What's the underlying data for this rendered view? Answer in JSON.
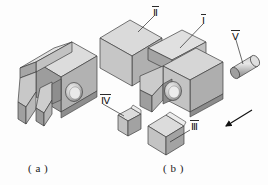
{
  "figure": {
    "type": "engineering-isometric-exploded-assembly",
    "width": 268,
    "height": 185,
    "background": "#fdfdfd"
  },
  "captions": {
    "a": "( a )",
    "b": "( b )"
  },
  "part_labels": {
    "I": "Ⅰ",
    "II": "Ⅱ",
    "III": "Ⅲ",
    "IV": "Ⅳ",
    "V": "Ⅴ"
  },
  "colors": {
    "outline": "#3a3a3a",
    "face_top": "#d2d2d2",
    "face_front": "#b4b4b4",
    "face_side": "#9a9a9a",
    "face_dark": "#868686",
    "face_light": "#dedede",
    "hole_shadow": "#8f8f8f",
    "hole_highlight": "#efefef",
    "arrow": "#1a1a1a",
    "leader": "#2a2a2a",
    "text": "#111111"
  },
  "views": {
    "a": {
      "name": "assembled-view",
      "description": "assembled bracket body with angled rib, slot and through hole"
    },
    "b": {
      "name": "exploded-view",
      "description": "exploded assembly: main body I, cube block II, wedge III, wedge IV, cylindrical pin V"
    }
  },
  "arrow": {
    "name": "assembly-direction-arrow",
    "direction": "down-left"
  }
}
